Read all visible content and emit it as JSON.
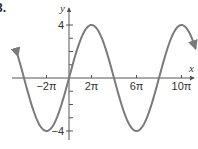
{
  "problem": {
    "number": "3."
  },
  "chart_data": {
    "type": "line",
    "title": "",
    "function": "y = 4 sin(x/4)",
    "xlabel": "x",
    "ylabel": "y",
    "x_ticks": [
      {
        "value": "-2π",
        "label": "−2π"
      },
      {
        "value": "2π",
        "label": "2π"
      },
      {
        "value": "6π",
        "label": "6π"
      },
      {
        "value": "10π",
        "label": "10π"
      }
    ],
    "y_ticks": [
      {
        "value": 4,
        "label": "4"
      },
      {
        "value": -4,
        "label": "−4"
      }
    ],
    "y_minor_ticks": [
      1,
      2,
      3,
      -1,
      -2,
      -3
    ],
    "xlim_pi_units": [
      -4.3,
      11.3
    ],
    "ylim": [
      -4.5,
      4.5
    ],
    "key_points": [
      {
        "x": "-4π",
        "y": 0
      },
      {
        "x": "-2π",
        "y": -4
      },
      {
        "x": "0",
        "y": 0
      },
      {
        "x": "2π",
        "y": 4
      },
      {
        "x": "4π",
        "y": 0
      },
      {
        "x": "6π",
        "y": -4
      },
      {
        "x": "8π",
        "y": 0
      },
      {
        "x": "10π",
        "y": 4
      }
    ],
    "amplitude": 4,
    "period": "8π",
    "grid": false,
    "arrows_on_curve_ends": true,
    "curve_color": "#7a7a7a",
    "axis_color": "#555555"
  }
}
